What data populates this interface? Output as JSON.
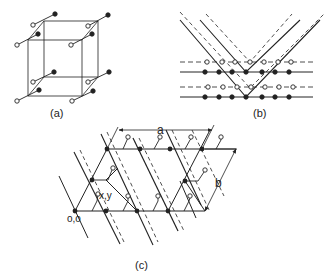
{
  "figure": {
    "panels": [
      {
        "id": "a",
        "label": "(a)",
        "description": "Cube lattice with a dumbbell (open circle + filled dot) at each corner"
      },
      {
        "id": "b",
        "label": "(b)",
        "description": "Rows of open circles on dashed lines and filled dots on solid lines, crossed by V-shaped solid and dashed lines"
      },
      {
        "id": "c",
        "label": "(c)",
        "description": "Oblique 2D lattice with basis; open circle at x,y offset from filled dot at origin"
      }
    ],
    "annotations": {
      "a_dimension": "a",
      "b_dimension": "b",
      "origin": "o,o",
      "basis_position": "x,y"
    },
    "colors": {
      "line": "#222222",
      "background": "#ffffff"
    }
  }
}
